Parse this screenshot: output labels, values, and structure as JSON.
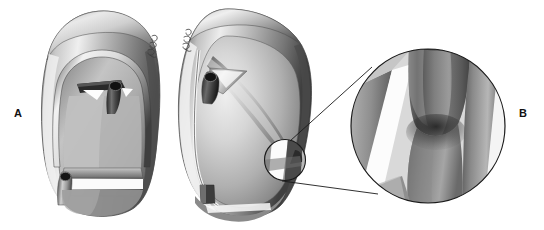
{
  "figure": {
    "type": "anatomical-illustration",
    "medium": "grayscale pencil / airbrush rendering",
    "background_color": "#ffffff",
    "width": 544,
    "height": 230
  },
  "labels": {
    "panel_a": "A",
    "panel_b": "B"
  },
  "panels": [
    {
      "id": "panel-a-left-view",
      "label": "A",
      "description": "Anterior view of the structure: an elongated rounded-triangular hollow body with a thick curved outer rim, an inner arch at the top containing a dark horizontal bar and a short cylindrical tube, and a horizontal bar with a cylindrical opening near the base.",
      "bounds": {
        "x": 40,
        "y": 10,
        "width": 122,
        "height": 206
      },
      "features": [
        "outer curved rim",
        "inner arch",
        "upper dark horizontal strut",
        "upper cylindrical tube opening",
        "lower horizontal bar",
        "lower cylindrical tube opening",
        "artist signature mark"
      ]
    },
    {
      "id": "panel-a-right-view",
      "label": "A",
      "description": "Oblique / lateral view of the same structure, rotated, showing the rim, the angled internal strut with its cylindrical opening at upper left, a broad smooth lateral wall, and a small cylindrical element at the lower edge.",
      "bounds": {
        "x": 168,
        "y": 8,
        "width": 144,
        "height": 212
      },
      "features": [
        "outer curved rim",
        "angled internal strut",
        "cylindrical tube opening",
        "smooth lateral wall",
        "lower cylindrical element",
        "artist signature mark",
        "detail callout circle"
      ]
    },
    {
      "id": "panel-b-magnified-detail",
      "label": "B",
      "description": "Circular magnified inset showing the junction where a thick cylindrical column meets two angled bands, rendered with strong light and shadow gradients.",
      "bounds": {
        "x": 350,
        "y": 50,
        "width": 156,
        "height": 152
      },
      "features": [
        "magnification circle outline",
        "vertical cylindrical column",
        "left angled band",
        "right angled band",
        "highlight wedge",
        "deep shadow at junction"
      ]
    }
  ],
  "callout": {
    "source_circle": {
      "cx": 285,
      "cy": 160,
      "r": 21
    },
    "target_circle": {
      "cx": 428,
      "cy": 126,
      "r": 78
    },
    "leader_lines": 2,
    "stroke_color": "#1a1a1a"
  },
  "palette": {
    "background": "#ffffff",
    "ink": "#111111",
    "highlight": "#f4f4f4",
    "light_gray": "#d2d2d2",
    "mid_gray": "#9a9a9a",
    "dark_gray": "#5d5d5d",
    "shadow": "#2b2b2b",
    "deep_shadow": "#161616"
  }
}
